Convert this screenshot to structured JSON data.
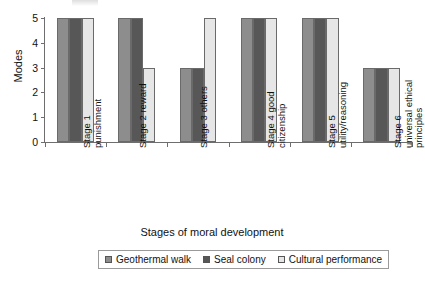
{
  "chart_data": {
    "type": "bar",
    "title": "",
    "xlabel": "Stages of moral development",
    "ylabel": "Modes",
    "ylim": [
      0,
      5
    ],
    "yticks": [
      0,
      1,
      2,
      3,
      4,
      5
    ],
    "grid": false,
    "legend_position": "bottom",
    "categories": [
      "Stage 1\npunishment",
      "Stage 2 reward",
      "Stage 3 others",
      "Stage 4 good\ncitizenship",
      "Stage 5\nutility/reasoning",
      "Stage 6\nuniversal ethical\nprinciples"
    ],
    "series": [
      {
        "name": "Geothermal walk",
        "color": "#8d8d8d",
        "values": [
          5,
          5,
          3,
          5,
          5,
          3
        ]
      },
      {
        "name": "Seal colony",
        "color": "#575757",
        "values": [
          5,
          5,
          3,
          5,
          5,
          3
        ]
      },
      {
        "name": "Cultural performance",
        "color": "#e6e6e6",
        "values": [
          5,
          3,
          5,
          5,
          5,
          3
        ]
      }
    ]
  },
  "axis": {
    "border_color": "#6e6e6e",
    "bar_border_color": "#6a6a6a"
  }
}
